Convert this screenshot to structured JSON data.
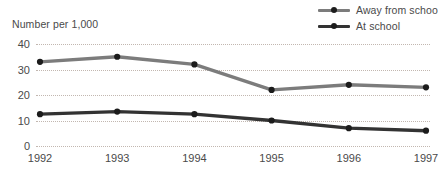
{
  "chart_data": {
    "type": "line",
    "title": "",
    "xlabel": "",
    "ylabel": "Number per 1,000",
    "categories": [
      "1992",
      "1993",
      "1994",
      "1995",
      "1996",
      "1997"
    ],
    "ylim": [
      0,
      40
    ],
    "yticks": [
      40,
      30,
      20,
      10,
      0
    ],
    "grid": true,
    "legend_position": "top-right",
    "series": [
      {
        "name": "Away from schoo",
        "color": "#7c7c7c",
        "marker_color": "#1c1c1c",
        "values": [
          33,
          35,
          32,
          22,
          24,
          23
        ]
      },
      {
        "name": "At school",
        "color": "#333333",
        "marker_color": "#1c1c1c",
        "values": [
          12.5,
          13.5,
          12.5,
          10,
          7,
          6
        ]
      }
    ]
  },
  "axis": {
    "y_title": "Number per 1,000"
  },
  "colors": {
    "gridline": "#c2b7b0",
    "text": "#4a4a4a",
    "background": "#ffffff"
  }
}
